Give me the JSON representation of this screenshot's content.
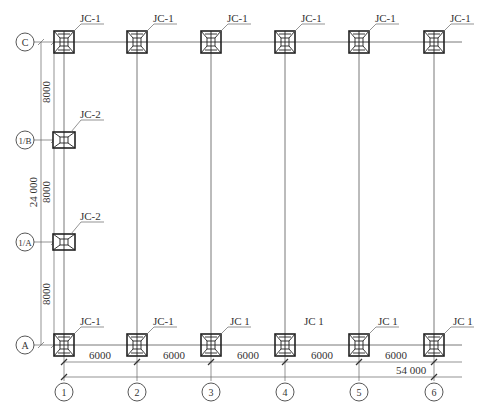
{
  "drawing": {
    "type": "foundation plan",
    "columns": [
      {
        "label": "1",
        "x": 64
      },
      {
        "label": "2",
        "x": 137
      },
      {
        "label": "3",
        "x": 211
      },
      {
        "label": "4",
        "x": 285
      },
      {
        "label": "5",
        "x": 359
      },
      {
        "label": "6",
        "x": 434
      }
    ],
    "rows": [
      {
        "label": "C",
        "y": 42
      },
      {
        "label": "1/B",
        "y": 140
      },
      {
        "label": "1/A",
        "y": 242
      },
      {
        "label": "A",
        "y": 345
      }
    ],
    "footings_top": [
      "JC-1",
      "JC-1",
      "JC-1",
      "JC-1",
      "JC-1",
      "JC-1"
    ],
    "footings_mid": [
      {
        "row": "1/B",
        "label": "JC-2"
      },
      {
        "row": "1/A",
        "label": "JC-2"
      }
    ],
    "footings_bottom": [
      "JC-1",
      "JC-1",
      "JC 1",
      "JC 1",
      "JC 1",
      "JC 1"
    ],
    "dimensions_horizontal": [
      "6000",
      "6000",
      "6000",
      "6000",
      "6000"
    ],
    "dimension_horizontal_total": "54 000",
    "dimensions_vertical": [
      "8000",
      "8000",
      "8000"
    ],
    "dimension_vertical_total": "24 000"
  }
}
